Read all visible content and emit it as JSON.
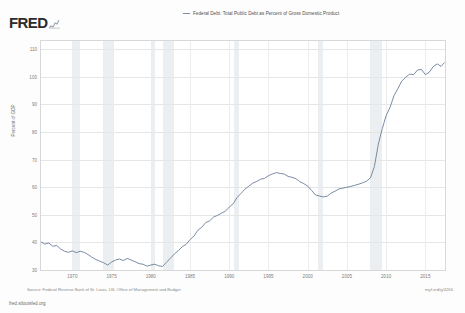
{
  "brand": {
    "name": "FRED",
    "sparkline_icon": "sparkline-icon"
  },
  "legend": {
    "series_label": "Federal Debt: Total Public Debt as Percent of Gross Domestic Product",
    "line_color": "#7b8fa8"
  },
  "footer": {
    "source": "Source: Federal Reserve Bank of St. Louis, US. Office of Management and Budget",
    "permalink": "myf.red/g/4266",
    "site": "fred.stlouisfed.org"
  },
  "chart_data": {
    "type": "line",
    "title": "",
    "xlabel": "",
    "ylabel": "Percent of GDP",
    "xlim": [
      1966,
      2017.5
    ],
    "ylim": [
      30,
      113
    ],
    "grid": true,
    "legend_position": "top-center",
    "xticks": [
      1970,
      1975,
      1980,
      1985,
      1990,
      1995,
      2000,
      2005,
      2010,
      2015
    ],
    "yticks": [
      30,
      40,
      50,
      60,
      70,
      80,
      90,
      100,
      110
    ],
    "series": [
      {
        "name": "Federal Debt: Total Public Debt as Percent of Gross Domestic Product",
        "color": "#6b7f99",
        "x": [
          1966.0,
          1966.5,
          1967.0,
          1967.5,
          1968.0,
          1968.5,
          1969.0,
          1969.5,
          1970.0,
          1970.5,
          1971.0,
          1971.5,
          1972.0,
          1972.5,
          1973.0,
          1973.5,
          1974.0,
          1974.5,
          1975.0,
          1975.5,
          1976.0,
          1976.5,
          1977.0,
          1977.5,
          1978.0,
          1978.5,
          1979.0,
          1979.5,
          1980.0,
          1980.5,
          1981.0,
          1981.5,
          1982.0,
          1982.5,
          1983.0,
          1983.5,
          1984.0,
          1984.5,
          1985.0,
          1985.5,
          1986.0,
          1986.5,
          1987.0,
          1987.5,
          1988.0,
          1988.5,
          1989.0,
          1989.5,
          1990.0,
          1990.5,
          1991.0,
          1991.5,
          1992.0,
          1992.5,
          1993.0,
          1993.5,
          1994.0,
          1994.5,
          1995.0,
          1995.5,
          1996.0,
          1996.5,
          1997.0,
          1997.5,
          1998.0,
          1998.5,
          1999.0,
          1999.5,
          2000.0,
          2000.5,
          2001.0,
          2001.5,
          2002.0,
          2002.5,
          2003.0,
          2003.5,
          2004.0,
          2004.5,
          2005.0,
          2005.5,
          2006.0,
          2006.5,
          2007.0,
          2007.5,
          2008.0,
          2008.5,
          2009.0,
          2009.5,
          2010.0,
          2010.5,
          2011.0,
          2011.5,
          2012.0,
          2012.5,
          2013.0,
          2013.5,
          2014.0,
          2014.5,
          2015.0,
          2015.5,
          2016.0,
          2016.5,
          2017.0,
          2017.4
        ],
        "y": [
          40.2,
          39.4,
          39.8,
          38.6,
          38.9,
          37.6,
          36.8,
          36.4,
          36.9,
          36.3,
          36.8,
          36.4,
          35.6,
          34.6,
          33.8,
          33.2,
          32.6,
          31.8,
          32.9,
          33.6,
          34.0,
          33.4,
          34.2,
          33.6,
          33.0,
          32.3,
          32.1,
          31.4,
          31.8,
          32.1,
          31.5,
          31.3,
          32.8,
          34.3,
          35.8,
          37.0,
          38.4,
          39.3,
          41.0,
          42.3,
          44.4,
          45.5,
          47.2,
          47.8,
          49.2,
          49.8,
          50.6,
          51.3,
          52.8,
          54.0,
          56.3,
          57.8,
          59.3,
          60.4,
          61.5,
          62.1,
          62.9,
          63.2,
          64.2,
          64.8,
          65.3,
          65.0,
          64.8,
          63.9,
          63.6,
          63.1,
          62.0,
          61.3,
          60.4,
          58.8,
          57.2,
          56.8,
          56.5,
          56.8,
          57.9,
          58.6,
          59.4,
          59.7,
          60.0,
          60.3,
          60.7,
          61.1,
          61.6,
          62.2,
          63.4,
          67.5,
          75.6,
          81.2,
          86.0,
          89.0,
          93.2,
          95.8,
          98.5,
          99.9,
          101.0,
          100.8,
          102.5,
          102.7,
          100.8,
          101.7,
          103.7,
          104.7,
          103.8,
          105.1
        ]
      }
    ],
    "recessions": [
      {
        "start": 1969.92,
        "end": 1970.92
      },
      {
        "start": 1973.92,
        "end": 1975.25
      },
      {
        "start": 1980.08,
        "end": 1980.58
      },
      {
        "start": 1981.58,
        "end": 1982.92
      },
      {
        "start": 1990.58,
        "end": 1991.25
      },
      {
        "start": 2001.25,
        "end": 2001.92
      },
      {
        "start": 2007.92,
        "end": 2009.5
      }
    ],
    "recession_shade_color": "#eceff1"
  }
}
